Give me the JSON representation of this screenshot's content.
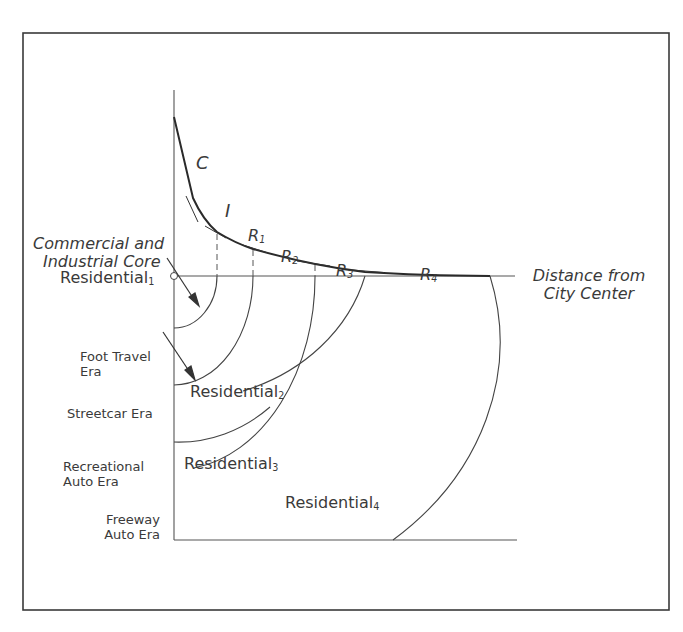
{
  "figure": {
    "curve_labels": {
      "C": "C",
      "I": "I",
      "R1": "R",
      "R1_sub": "1",
      "R2": "R",
      "R2_sub": "2",
      "R3": "R",
      "R3_sub": "3",
      "R4": "R",
      "R4_sub": "4"
    },
    "core_label": {
      "line1": "Commercial and",
      "line2": "Industrial Core"
    },
    "axis_label": {
      "line1": "Distance from",
      "line2": "City Center"
    },
    "zones": [
      {
        "name": "Residential",
        "sub": "1"
      },
      {
        "name": "Residential",
        "sub": "2"
      },
      {
        "name": "Residential",
        "sub": "3"
      },
      {
        "name": "Residential",
        "sub": "4"
      }
    ],
    "eras": [
      {
        "line1": "Foot Travel",
        "line2": "Era"
      },
      {
        "line1": "Streetcar Era",
        "line2": ""
      },
      {
        "line1": "Recreational",
        "line2": "Auto Era"
      },
      {
        "line1": "Freeway",
        "line2": "Auto Era"
      }
    ],
    "colors": {
      "ink": "#3a3a3a",
      "background": "#ffffff"
    }
  }
}
